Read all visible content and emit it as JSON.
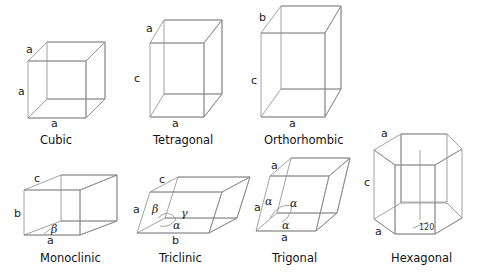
{
  "colors": {
    "face_light": "#d9d9d9",
    "face_mid": "#c6c6c6",
    "face_dark": "#aaaaaa",
    "edge": "#8a8a8a",
    "text": "#222222"
  },
  "systems": [
    {
      "name": "Cubic",
      "edge_labels": {
        "top": "a",
        "side": "a",
        "bottom": "a"
      }
    },
    {
      "name": "Tetragonal",
      "edge_labels": {
        "top": "a",
        "side": "c",
        "bottom": "a"
      }
    },
    {
      "name": "Orthorhombic",
      "edge_labels": {
        "top": "b",
        "side": "c",
        "bottom": "a"
      }
    },
    {
      "name": "Monoclinic",
      "edge_labels": {
        "top": "c",
        "side": "b",
        "bottom": "a"
      },
      "angles": [
        "β"
      ]
    },
    {
      "name": "Triclinic",
      "edge_labels": {
        "top": "c",
        "side": "a",
        "bottom": "b"
      },
      "angles": [
        "β",
        "γ",
        "α"
      ]
    },
    {
      "name": "Trigonal",
      "edge_labels": {
        "top": "a",
        "side": "a",
        "bottom": "a"
      },
      "angles": [
        "α",
        "α",
        "α"
      ]
    },
    {
      "name": "Hexagonal",
      "edge_labels": {
        "top": "a",
        "side": "c",
        "bottom": "a"
      },
      "angle_value": "120"
    }
  ]
}
